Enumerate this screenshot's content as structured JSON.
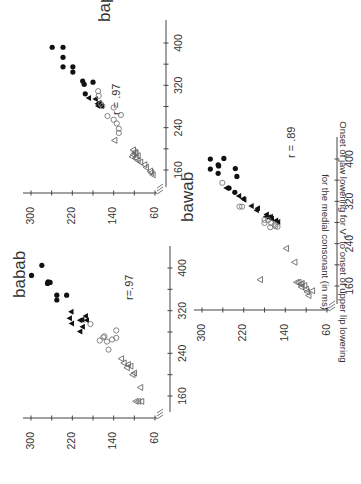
{
  "figure": {
    "ylabel_line1": "Onset of jaw lowering for V",
    "ylabel_sub": "1",
    "ylabel_line1_rest": " to onset of upper lip lowering",
    "ylabel_line2": "for the medial consonant (in ms)",
    "orientation": "rotated 90 degrees counterclockwise"
  },
  "chart_data": [
    {
      "type": "scatter",
      "title": "bapab",
      "annotation": "r = .97",
      "xlabel": "",
      "ylabel": "Onset of jaw lowering for V1 to onset of upper lip lowering for the medial consonant (in ms)",
      "xlim": [
        140,
        420
      ],
      "ylim": [
        50,
        310
      ],
      "x_ticks": [
        160,
        240,
        320,
        400
      ],
      "y_ticks": [
        60,
        140,
        220,
        300
      ],
      "grid": false,
      "series": [
        {
          "name": "filled-circle",
          "marker": "filled-circle",
          "points": [
            [
              392,
              259
            ],
            [
              392,
              238
            ],
            [
              373,
              238
            ],
            [
              355,
              238
            ],
            [
              355,
              219
            ],
            [
              345,
              219
            ],
            [
              328,
              200
            ],
            [
              322,
              197
            ],
            [
              326,
              180
            ],
            [
              304,
              195
            ]
          ]
        },
        {
          "name": "filled-triangle",
          "marker": "filled-triangle",
          "points": [
            [
              296,
              188
            ],
            [
              294,
              175
            ],
            [
              287,
              168
            ],
            [
              283,
              167
            ],
            [
              281,
              163
            ],
            [
              285,
              171
            ],
            [
              281,
              170
            ]
          ]
        },
        {
          "name": "open-circle",
          "marker": "open-circle",
          "points": [
            [
              309,
              170
            ],
            [
              300,
              169
            ],
            [
              285,
              165
            ],
            [
              281,
              162
            ],
            [
              262,
              152
            ],
            [
              255,
              140
            ],
            [
              248,
              134
            ],
            [
              238,
              130
            ],
            [
              230,
              130
            ],
            [
              264,
              126
            ],
            [
              278,
              140
            ]
          ]
        },
        {
          "name": "open-triangle",
          "marker": "open-triangle",
          "points": [
            [
              216,
              138
            ],
            [
              198,
              102
            ],
            [
              194,
              99
            ],
            [
              192,
              97
            ],
            [
              189,
              102
            ],
            [
              187,
              93
            ],
            [
              185,
              104
            ],
            [
              183,
              97
            ],
            [
              178,
              93
            ],
            [
              175,
              88
            ],
            [
              170,
              80
            ],
            [
              165,
              77
            ],
            [
              158,
              69
            ],
            [
              155,
              67
            ],
            [
              151,
              64
            ]
          ]
        }
      ]
    },
    {
      "type": "scatter",
      "title": "babab",
      "annotation": "r=.97",
      "xlabel": "",
      "ylabel": "Onset of jaw lowering for V1 to onset of upper lip lowering for the medial consonant (in ms)",
      "xlim": [
        140,
        420
      ],
      "ylim": [
        50,
        310
      ],
      "x_ticks": [
        160,
        240,
        320,
        400
      ],
      "y_ticks": [
        60,
        140,
        220,
        300
      ],
      "grid": false,
      "series": [
        {
          "name": "filled-circle",
          "marker": "filled-circle",
          "points": [
            [
              386,
              299
            ],
            [
              405,
              279
            ],
            [
              374,
              267
            ],
            [
              371,
              268
            ],
            [
              373,
              263
            ],
            [
              349,
              250
            ],
            [
              340,
              250
            ],
            [
              349,
              231
            ]
          ]
        },
        {
          "name": "filled-triangle",
          "marker": "filled-triangle",
          "points": [
            [
              318,
              222
            ],
            [
              306,
              225
            ],
            [
              296,
              221
            ],
            [
              281,
              205
            ],
            [
              302,
              205
            ],
            [
              310,
              194
            ],
            [
              302,
              192
            ],
            [
              290,
              200
            ],
            [
              303,
              201
            ]
          ]
        },
        {
          "name": "open-circle",
          "marker": "open-circle",
          "points": [
            [
              295,
              185
            ],
            [
              270,
              160
            ],
            [
              272,
              158
            ],
            [
              264,
              167
            ],
            [
              266,
              143
            ],
            [
              247,
              150
            ],
            [
              262,
              153
            ],
            [
              269,
              135
            ],
            [
              283,
              135
            ]
          ]
        },
        {
          "name": "open-triangle",
          "marker": "open-triangle",
          "points": [
            [
              230,
              125
            ],
            [
              222,
              120
            ],
            [
              219,
              112
            ],
            [
              216,
              107
            ],
            [
              213,
              114
            ],
            [
              203,
              100
            ],
            [
              200,
              103
            ],
            [
              176,
              88
            ],
            [
              150,
              97
            ],
            [
              150,
              92
            ],
            [
              150,
              86
            ]
          ]
        }
      ]
    },
    {
      "type": "scatter",
      "title": "bawab",
      "annotation": "r = .89",
      "xlabel": "",
      "ylabel": "Onset of jaw lowering for V1 to onset of upper lip lowering for the medial consonant (in ms)",
      "xlim": [
        140,
        420
      ],
      "ylim": [
        50,
        310
      ],
      "x_ticks": [
        160,
        240,
        320,
        400
      ],
      "y_ticks": [
        60,
        140,
        220,
        300
      ],
      "grid": false,
      "series": [
        {
          "name": "filled-circle",
          "marker": "filled-circle",
          "points": [
            [
              400,
              284
            ],
            [
              401,
              258
            ],
            [
              381,
              284
            ],
            [
              389,
              269
            ],
            [
              387,
              268
            ],
            [
              373,
              269
            ],
            [
              382,
              236
            ],
            [
              367,
              233
            ],
            [
              345,
              248
            ],
            [
              337,
              237
            ]
          ]
        },
        {
          "name": "filled-triangle",
          "marker": "filled-triangle",
          "points": [
            [
              345,
              253
            ],
            [
              330,
              229
            ],
            [
              325,
              221
            ],
            [
              323,
              219
            ],
            [
              311,
              205
            ],
            [
              307,
              193
            ],
            [
              303,
              195
            ],
            [
              295,
              176
            ],
            [
              290,
              172
            ],
            [
              291,
              168
            ],
            [
              287,
              166
            ],
            [
              284,
              158
            ],
            [
              281,
              154
            ],
            [
              291,
              177
            ]
          ]
        },
        {
          "name": "open-circle",
          "marker": "open-circle",
          "points": [
            [
              355,
              261
            ],
            [
              310,
              228
            ],
            [
              310,
              223
            ],
            [
              285,
              180
            ],
            [
              285,
              173
            ],
            [
              279,
              180
            ],
            [
              279,
              167
            ],
            [
              276,
              160
            ],
            [
              272,
              155
            ],
            [
              271,
              169
            ],
            [
              273,
              159
            ]
          ]
        },
        {
          "name": "open-triangle",
          "marker": "open-triangle",
          "points": [
            [
              231,
              138
            ],
            [
              205,
              122
            ],
            [
              172,
              188
            ],
            [
              167,
              118
            ],
            [
              167,
              114
            ],
            [
              165,
              108
            ],
            [
              163,
              110
            ],
            [
              161,
              103
            ],
            [
              158,
              109
            ],
            [
              151,
              88
            ],
            [
              149,
              98
            ],
            [
              142,
              95
            ],
            [
              154,
              100
            ]
          ]
        }
      ]
    }
  ]
}
